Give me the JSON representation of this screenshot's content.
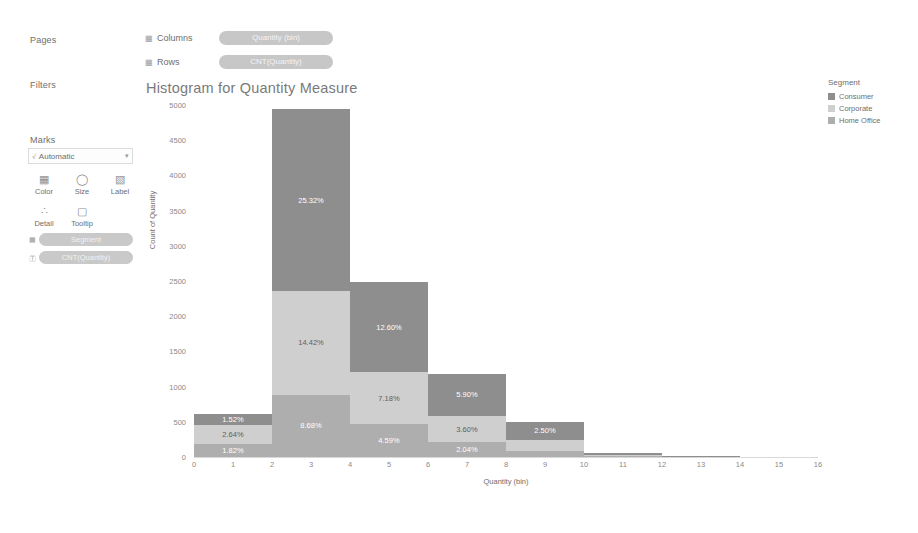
{
  "shelves": {
    "pages_label": "Pages",
    "filters_label": "Filters",
    "marks_label": "Marks",
    "columns": {
      "icon": "grid-icon",
      "label": "Columns",
      "pill": "Quantity (bin)"
    },
    "rows": {
      "icon": "grid-icon",
      "label": "Rows",
      "pill": "CNT(Quantity)"
    }
  },
  "marks_card": {
    "type_icon": "mark-type-icon",
    "type_value": "Automatic",
    "caret": "▾",
    "buttons": [
      {
        "glyph": "▦",
        "label": "Color",
        "name": "color-button"
      },
      {
        "glyph": "◯",
        "label": "Size",
        "name": "size-button"
      },
      {
        "glyph": "▧",
        "label": "Label",
        "name": "label-button"
      },
      {
        "glyph": "∴",
        "label": "Detail",
        "name": "detail-button"
      },
      {
        "glyph": "▢",
        "label": "Tooltip",
        "name": "tooltip-button"
      }
    ],
    "pills": [
      {
        "icon": "▦",
        "text": "Segment"
      },
      {
        "icon": "Ⓣ",
        "text": "CNT(Quantity)"
      }
    ]
  },
  "chart_title": "Histogram for Quantity Measure",
  "legend": {
    "title": "Segment",
    "items": [
      {
        "label": "Consumer",
        "color": "#8e8e8e"
      },
      {
        "label": "Corporate",
        "color": "#cfcfcf"
      },
      {
        "label": "Home Office",
        "color": "#aeaeae"
      }
    ]
  },
  "chart_data": {
    "type": "bar",
    "title": "Histogram for Quantity Measure",
    "xlabel": "Quantity (bin)",
    "ylabel": "Count of Quantity",
    "stacked": true,
    "grid": false,
    "legend_position": "right",
    "ylim": [
      0,
      5000
    ],
    "ytick_values": [
      0,
      500,
      1000,
      1500,
      2000,
      2500,
      3000,
      3500,
      4000,
      4500,
      5000
    ],
    "ytick_labels": [
      "0",
      "500",
      "1000",
      "1500",
      "2000",
      "2500",
      "3000",
      "3500",
      "4000",
      "4500",
      "5000"
    ],
    "xtick_values": [
      0,
      1,
      2,
      3,
      4,
      5,
      6,
      7,
      8,
      9,
      10,
      11,
      12,
      13,
      14,
      15,
      16
    ],
    "xtick_labels": [
      "0",
      "1",
      "2",
      "3",
      "4",
      "5",
      "6",
      "7",
      "8",
      "9",
      "10",
      "11",
      "12",
      "13",
      "14",
      "15",
      "16"
    ],
    "bin_width": 2,
    "bin_starts": [
      0,
      2,
      4,
      6,
      8,
      10,
      12,
      14
    ],
    "series": [
      {
        "name": "Consumer",
        "color": "#8e8e8e",
        "values": [
          155,
          2585,
          1286,
          602,
          255,
          30,
          6,
          2
        ]
      },
      {
        "name": "Corporate",
        "color": "#cfcfcf",
        "values": [
          269,
          1472,
          733,
          367,
          155,
          18,
          4,
          1
        ]
      },
      {
        "name": "Home Office",
        "color": "#aeaeae",
        "values": [
          186,
          886,
          469,
          214,
          92,
          11,
          2,
          1
        ]
      }
    ],
    "data_labels": [
      {
        "bin": 0,
        "series": "Consumer",
        "text": "1.52%"
      },
      {
        "bin": 0,
        "series": "Corporate",
        "text": "2.64%"
      },
      {
        "bin": 0,
        "series": "Home Office",
        "text": "1.82%"
      },
      {
        "bin": 2,
        "series": "Consumer",
        "text": "25.32%"
      },
      {
        "bin": 2,
        "series": "Corporate",
        "text": "14.42%"
      },
      {
        "bin": 2,
        "series": "Home Office",
        "text": "8.68%"
      },
      {
        "bin": 4,
        "series": "Consumer",
        "text": "12.60%"
      },
      {
        "bin": 4,
        "series": "Corporate",
        "text": "7.18%"
      },
      {
        "bin": 4,
        "series": "Home Office",
        "text": "4.59%"
      },
      {
        "bin": 6,
        "series": "Consumer",
        "text": "5.90%"
      },
      {
        "bin": 6,
        "series": "Corporate",
        "text": "3.60%"
      },
      {
        "bin": 6,
        "series": "Home Office",
        "text": "2.04%"
      },
      {
        "bin": 8,
        "series": "Consumer",
        "text": "2.50%"
      }
    ]
  }
}
